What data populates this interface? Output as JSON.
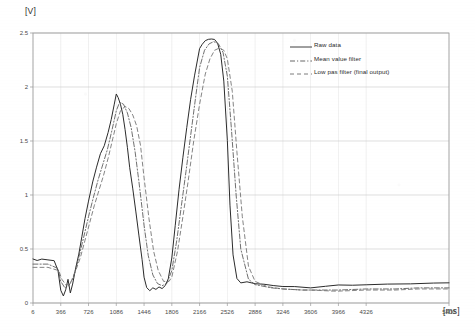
{
  "chart_data": {
    "type": "line",
    "title": "",
    "xlabel": "[ms]",
    "ylabel": "[V]",
    "xlim": [
      6,
      5400
    ],
    "ylim": [
      0,
      2.5
    ],
    "grid": true,
    "legend_position": "top-right",
    "xticks": [
      6,
      366,
      726,
      1086,
      1446,
      1806,
      2166,
      2526,
      2886,
      3246,
      3606,
      3966,
      4326,
      5400
    ],
    "yticks": [
      0,
      0.5,
      1,
      1.5,
      2,
      2.5
    ],
    "series": [
      {
        "name": "Raw data",
        "style": "solid",
        "color": "#2b2b2b",
        "x": [
          6,
          60,
          120,
          200,
          280,
          330,
          366,
          400,
          430,
          460,
          490,
          520,
          560,
          600,
          640,
          680,
          726,
          780,
          830,
          880,
          930,
          980,
          1020,
          1060,
          1086,
          1110,
          1140,
          1170,
          1200,
          1230,
          1260,
          1300,
          1340,
          1380,
          1420,
          1446,
          1480,
          1520,
          1560,
          1600,
          1640,
          1680,
          1720,
          1760,
          1806,
          1850,
          1900,
          1950,
          2000,
          2050,
          2100,
          2166,
          2200,
          2240,
          2280,
          2320,
          2360,
          2400,
          2440,
          2480,
          2526,
          2560,
          2600,
          2650,
          2700,
          2780,
          2886,
          3000,
          3120,
          3246,
          3400,
          3606,
          3800,
          3966,
          4150,
          4326,
          4600,
          4900,
          5200,
          5400
        ],
        "y": [
          0.4,
          0.4,
          0.4,
          0.4,
          0.39,
          0.3,
          0.12,
          0.06,
          0.12,
          0.22,
          0.1,
          0.18,
          0.32,
          0.46,
          0.62,
          0.78,
          0.95,
          1.12,
          1.26,
          1.38,
          1.46,
          1.58,
          1.7,
          1.84,
          1.93,
          1.9,
          1.84,
          1.74,
          1.6,
          1.44,
          1.26,
          1.06,
          0.84,
          0.62,
          0.4,
          0.24,
          0.15,
          0.12,
          0.14,
          0.13,
          0.15,
          0.14,
          0.16,
          0.22,
          0.42,
          0.72,
          1.05,
          1.35,
          1.62,
          1.88,
          2.1,
          2.35,
          2.4,
          2.43,
          2.44,
          2.45,
          2.44,
          2.4,
          2.3,
          2.05,
          1.5,
          0.9,
          0.45,
          0.22,
          0.18,
          0.19,
          0.18,
          0.17,
          0.16,
          0.15,
          0.15,
          0.14,
          0.15,
          0.16,
          0.16,
          0.17,
          0.17,
          0.18,
          0.18,
          0.18
        ]
      },
      {
        "name": "Mean value filter",
        "style": "dash-dot",
        "color": "#555555",
        "x": [
          6,
          200,
          330,
          366,
          420,
          470,
          520,
          570,
          620,
          680,
          726,
          790,
          850,
          910,
          970,
          1030,
          1086,
          1130,
          1180,
          1230,
          1280,
          1330,
          1380,
          1446,
          1500,
          1560,
          1620,
          1680,
          1740,
          1806,
          1870,
          1930,
          1990,
          2050,
          2110,
          2166,
          2230,
          2290,
          2350,
          2410,
          2470,
          2526,
          2580,
          2640,
          2700,
          2800,
          2886,
          3100,
          3246,
          3500,
          3606,
          3900,
          3966,
          4326,
          4700,
          5000,
          5400
        ],
        "y": [
          0.36,
          0.36,
          0.32,
          0.2,
          0.14,
          0.16,
          0.22,
          0.34,
          0.48,
          0.66,
          0.8,
          0.98,
          1.14,
          1.28,
          1.42,
          1.6,
          1.78,
          1.86,
          1.84,
          1.76,
          1.62,
          1.4,
          1.12,
          0.72,
          0.44,
          0.26,
          0.18,
          0.16,
          0.18,
          0.3,
          0.58,
          0.9,
          1.22,
          1.55,
          1.88,
          2.18,
          2.34,
          2.4,
          2.42,
          2.4,
          2.32,
          2.1,
          1.6,
          1.0,
          0.5,
          0.22,
          0.17,
          0.14,
          0.13,
          0.12,
          0.12,
          0.12,
          0.12,
          0.13,
          0.13,
          0.14,
          0.14
        ]
      },
      {
        "name": "Low pas filter (final output)",
        "style": "dashed",
        "color": "#6e6e6e",
        "x": [
          6,
          200,
          340,
          380,
          440,
          500,
          560,
          620,
          680,
          740,
          800,
          860,
          920,
          980,
          1040,
          1086,
          1140,
          1200,
          1250,
          1300,
          1350,
          1400,
          1446,
          1510,
          1570,
          1630,
          1700,
          1770,
          1806,
          1880,
          1950,
          2020,
          2090,
          2166,
          2240,
          2300,
          2360,
          2420,
          2480,
          2526,
          2590,
          2650,
          2720,
          2800,
          2886,
          3050,
          3246,
          3500,
          3606,
          3900,
          3966,
          4326,
          4700,
          5000,
          5400
        ],
        "y": [
          0.33,
          0.33,
          0.3,
          0.22,
          0.16,
          0.2,
          0.3,
          0.42,
          0.58,
          0.74,
          0.9,
          1.04,
          1.18,
          1.34,
          1.52,
          1.66,
          1.78,
          1.82,
          1.8,
          1.74,
          1.64,
          1.46,
          1.16,
          0.78,
          0.48,
          0.3,
          0.2,
          0.2,
          0.24,
          0.48,
          0.8,
          1.14,
          1.5,
          1.84,
          2.12,
          2.26,
          2.34,
          2.36,
          2.34,
          2.26,
          1.96,
          1.4,
          0.8,
          0.34,
          0.2,
          0.15,
          0.13,
          0.12,
          0.12,
          0.11,
          0.11,
          0.12,
          0.12,
          0.13,
          0.13
        ]
      }
    ]
  },
  "axes": {
    "y_unit": "[V]",
    "x_unit": "[ms]",
    "y_tick_labels": [
      "0",
      "0.5",
      "1",
      "1.5",
      "2",
      "2.5"
    ],
    "x_tick_labels": [
      "6",
      "366",
      "726",
      "1086",
      "1446",
      "1806",
      "2166",
      "2526",
      "2886",
      "3246",
      "3606",
      "3966",
      "4326",
      "5400"
    ]
  },
  "legend": {
    "items": [
      {
        "label": "Raw data",
        "style": "solid"
      },
      {
        "label": "Mean value filter",
        "style": "dash-dot"
      },
      {
        "label": "Low pas filter (final output)",
        "style": "dashed"
      }
    ]
  },
  "colors": {
    "raw": "#2b2b2b",
    "mean": "#555555",
    "lowpass": "#6e6e6e",
    "grid": "#c9c9c9",
    "frame": "#9a9a9a",
    "background": "#ffffff"
  }
}
